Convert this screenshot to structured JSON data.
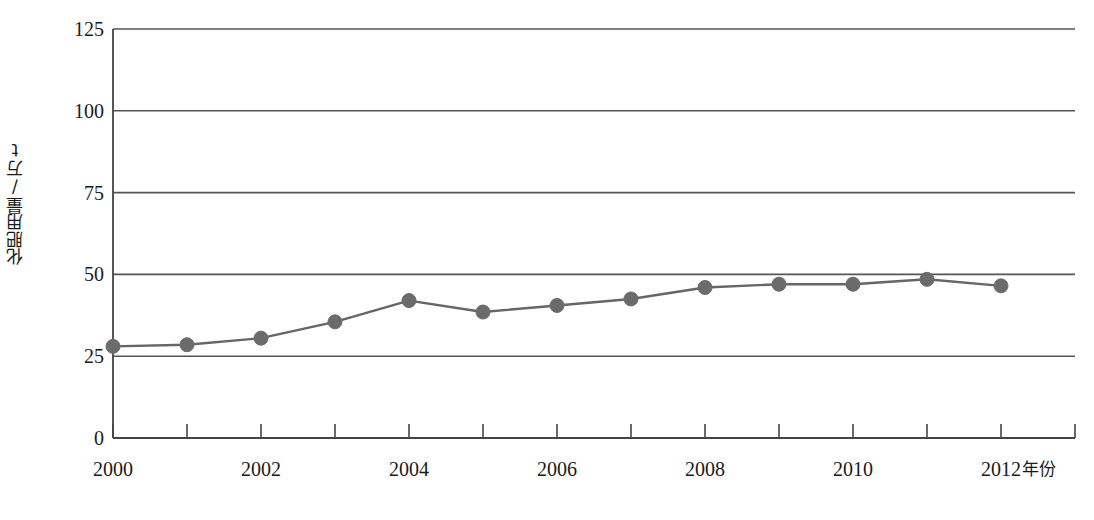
{
  "chart_data": {
    "type": "line",
    "title": "",
    "xlabel": "年份",
    "ylabel": "化肥用量/万t",
    "x": [
      2000,
      2001,
      2002,
      2003,
      2004,
      2005,
      2006,
      2007,
      2008,
      2009,
      2010,
      2011,
      2012
    ],
    "values": [
      28,
      28.5,
      30.5,
      35.5,
      42,
      38.5,
      40.5,
      42.5,
      46,
      47,
      47,
      48.5,
      46.5
    ],
    "series": [
      {
        "name": "化肥用量",
        "values": [
          28,
          28.5,
          30.5,
          35.5,
          42,
          38.5,
          40.5,
          42.5,
          46,
          47,
          47,
          48.5,
          46.5
        ]
      }
    ],
    "xlim": [
      2000,
      2013
    ],
    "ylim": [
      0,
      125
    ],
    "y_ticks": [
      0,
      25,
      50,
      75,
      100,
      125
    ],
    "y_tick_labels": [
      "0",
      "25",
      "50",
      "75",
      "100",
      "125"
    ],
    "x_ticks": [
      2000,
      2001,
      2002,
      2003,
      2004,
      2005,
      2006,
      2007,
      2008,
      2009,
      2010,
      2011,
      2012,
      2013
    ],
    "x_tick_labels": [
      "2000",
      "2002",
      "2004",
      "2006",
      "2008",
      "2010",
      "2012"
    ],
    "x_tick_label_values": [
      2000,
      2002,
      2004,
      2006,
      2008,
      2010,
      2012
    ],
    "grid": true,
    "grid_axis": "y",
    "legend": "none",
    "marker": "circle",
    "line_color": "#666666",
    "marker_color": "#6b6b6b",
    "grid_color": "#555555",
    "axis_color": "#444444"
  },
  "axis": {
    "y_title": "化肥用量/万t",
    "x_title": "年份",
    "y_labels": [
      "125",
      "100",
      "75",
      "50",
      "25",
      "0"
    ],
    "x_labels": [
      "2000",
      "2002",
      "2004",
      "2006",
      "2008",
      "2010",
      "2012"
    ]
  }
}
